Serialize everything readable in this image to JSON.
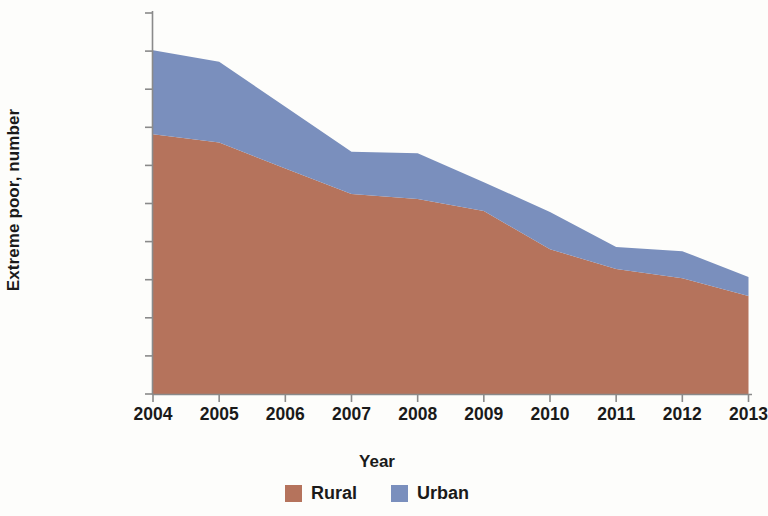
{
  "chart_data": {
    "type": "area",
    "stacked": true,
    "title": "",
    "xlabel": "Year",
    "ylabel": "Extreme poor, number",
    "categories": [
      "2004",
      "2005",
      "2006",
      "2007",
      "2008",
      "2009",
      "2010",
      "2011",
      "2012",
      "2013"
    ],
    "x": [
      2004,
      2005,
      2006,
      2007,
      2008,
      2009,
      2010,
      2011,
      2012,
      2013
    ],
    "series": [
      {
        "name": "Rural",
        "color": "#b5735c",
        "values": [
          3410000,
          3300000,
          2960000,
          2625000,
          2560000,
          2400000,
          1900000,
          1640000,
          1520000,
          1285000
        ]
      },
      {
        "name": "Urban",
        "color": "#7a8fbd",
        "values": [
          1100000,
          1060000,
          810000,
          555000,
          600000,
          380000,
          490000,
          290000,
          355000,
          250000
        ]
      }
    ],
    "totals": [
      4510000,
      4360000,
      3770000,
      3180000,
      3160000,
      2780000,
      2390000,
      1930000,
      1875000,
      1535000
    ],
    "ylim": [
      0,
      5000000
    ],
    "ytick_values": [
      0,
      500000,
      1000000,
      1500000,
      2000000,
      2500000,
      3000000,
      3500000,
      4000000,
      4500000,
      5000000
    ],
    "ytick_labels": [
      "0",
      "500,000",
      "1,000,000",
      "1,500,000",
      "2,000,000",
      "2,500,000",
      "3,000,000",
      "3,500,000",
      "4,000,000",
      "4,500,000",
      "5,000,000"
    ],
    "grid": false,
    "legend_position": "bottom",
    "legend_entries": [
      "Rural",
      "Urban"
    ]
  },
  "axes": {
    "y_title": "Extreme poor, number",
    "x_title": "Year"
  },
  "legend": {
    "items": [
      {
        "label": "Rural",
        "color": "#b5735c"
      },
      {
        "label": "Urban",
        "color": "#7a8fbd"
      }
    ]
  },
  "colors": {
    "rural": "#b5735c",
    "urban": "#7a8fbd",
    "axis": "#8a8a8a",
    "text": "#1a1a1a",
    "background": "#fdfdfb"
  }
}
